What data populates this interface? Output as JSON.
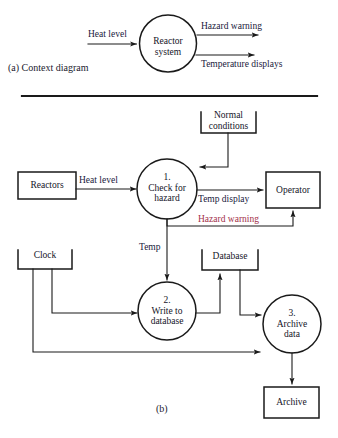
{
  "figure": {
    "part_a_caption": "(a)  Context diagram",
    "part_b_caption": "(b)",
    "colors": {
      "stroke": "#1a1a1a",
      "label": "#20203c",
      "alert": "#a3304a",
      "background": "#ffffff"
    }
  },
  "context_diagram": {
    "process": {
      "name": "reactor-system",
      "line1": "Reactor",
      "line2": "system"
    },
    "flows": [
      {
        "name": "heat-level-in",
        "label": "Heat level",
        "direction": "in"
      },
      {
        "name": "hazard-warning-out",
        "label": "Hazard warning",
        "direction": "out"
      },
      {
        "name": "temperature-displays-out",
        "label": "Temperature displays",
        "direction": "out"
      }
    ]
  },
  "level1_diagram": {
    "processes": [
      {
        "name": "check-for-hazard",
        "number": "1.",
        "line1": "Check for",
        "line2": "hazard"
      },
      {
        "name": "write-to-database",
        "number": "2.",
        "line1": "Write to",
        "line2": "database"
      },
      {
        "name": "archive-data",
        "number": "3.",
        "line1": "Archive",
        "line2": "data"
      }
    ],
    "entities": [
      {
        "name": "reactors-entity",
        "label": "Reactors"
      },
      {
        "name": "operator-entity",
        "label": "Operator"
      },
      {
        "name": "archive-entity",
        "label": "Archive"
      }
    ],
    "datastores": [
      {
        "name": "normal-conditions-store",
        "line1": "Normal",
        "line2": "conditions"
      },
      {
        "name": "clock-store",
        "line1": "Clock",
        "line2": ""
      },
      {
        "name": "database-store",
        "line1": "Database",
        "line2": ""
      }
    ],
    "flows": [
      {
        "name": "flow-heat-level",
        "label": "Heat level",
        "alert": false
      },
      {
        "name": "flow-temp-display",
        "label": "Temp display",
        "alert": false
      },
      {
        "name": "flow-hazard-warning",
        "label": "Hazard warning",
        "alert": true
      },
      {
        "name": "flow-temp",
        "label": "Temp",
        "alert": false
      }
    ]
  }
}
